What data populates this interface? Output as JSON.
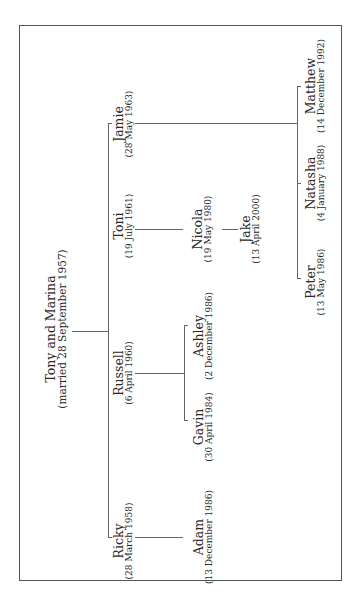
{
  "tree": {
    "root": {
      "name": "Tony and Marina",
      "date": "(married 28 September 1957)"
    },
    "children": [
      {
        "name": "Ricky",
        "date": "(28 March 1958)"
      },
      {
        "name": "Russell",
        "date": "(6 April 1960)"
      },
      {
        "name": "Toni",
        "date": "(19 July 1961)"
      },
      {
        "name": "Jamie",
        "date": "(28 May 1963)"
      }
    ],
    "grandchildren": {
      "ricky": [
        {
          "name": "Adam",
          "date": "(13 December 1986)"
        }
      ],
      "russell": [
        {
          "name": "Gavin",
          "date": "(30 April 1984)"
        },
        {
          "name": "Ashley",
          "date": "(2 December 1986)"
        }
      ],
      "toni": [
        {
          "name": "Nicola",
          "date": "(19 May 1980)"
        }
      ],
      "jamie": [
        {
          "name": "Peter",
          "date": "(13 May 1986)"
        },
        {
          "name": "Natasha",
          "date": "(4 January 1988)"
        },
        {
          "name": "Matthew",
          "date": "(14 December 1992)"
        }
      ]
    },
    "great_grandchildren": {
      "nicola": [
        {
          "name": "Jake",
          "date": "(13 April 2000)"
        }
      ]
    }
  }
}
